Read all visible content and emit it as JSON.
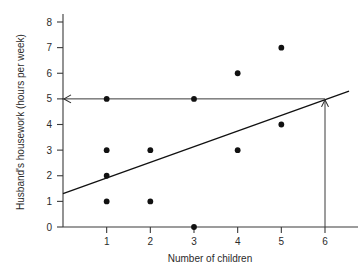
{
  "chart_data": {
    "type": "scatter",
    "title": "",
    "xlabel": "Number of children",
    "ylabel": "Husband's housework (hours per week)",
    "xlim": [
      0,
      6.6
    ],
    "ylim": [
      0,
      8.4
    ],
    "xticks": [
      1,
      2,
      3,
      4,
      5,
      6
    ],
    "xtick_labels": [
      "1",
      "2",
      "3",
      "4",
      "5",
      "6"
    ],
    "yticks": [
      0,
      1,
      2,
      3,
      4,
      5,
      6,
      7,
      8
    ],
    "ytick_labels": [
      "0",
      "1",
      "2",
      "3",
      "4",
      "5",
      "6",
      "7",
      "8"
    ],
    "grid": false,
    "legend": "none",
    "points": [
      {
        "x": 1,
        "y": 5
      },
      {
        "x": 1,
        "y": 3
      },
      {
        "x": 1,
        "y": 2
      },
      {
        "x": 1,
        "y": 1
      },
      {
        "x": 2,
        "y": 3
      },
      {
        "x": 2,
        "y": 1
      },
      {
        "x": 3,
        "y": 5
      },
      {
        "x": 3,
        "y": 0
      },
      {
        "x": 4,
        "y": 6
      },
      {
        "x": 4,
        "y": 3
      },
      {
        "x": 5,
        "y": 7
      },
      {
        "x": 5,
        "y": 4
      }
    ],
    "regression_line": {
      "label": "regression line",
      "x_start": 0,
      "y_start": 1.3,
      "x_end": 6.55,
      "y_end": 5.3
    },
    "annotations": [
      {
        "name": "prediction-vertical-arrow",
        "description": "vertical arrow from x = 6 on x-axis up to the regression line",
        "x": 6,
        "y_start": 0,
        "y_end": 5.0
      },
      {
        "name": "prediction-horizontal-arrow",
        "description": "horizontal arrow from the regression line at x = 6 leftwards to the y-axis at y = 5",
        "y": 5,
        "x_start": 6,
        "x_end": 0
      }
    ]
  },
  "axes": {
    "x_title": "Number of children",
    "y_title": "Husband's housework (hours per week)"
  },
  "colors": {
    "point": "#111111",
    "line": "#111111",
    "axis": "#3a3a3a",
    "guide": "#3a3a3a",
    "background": "#ffffff",
    "text": "#2b2b2b"
  }
}
